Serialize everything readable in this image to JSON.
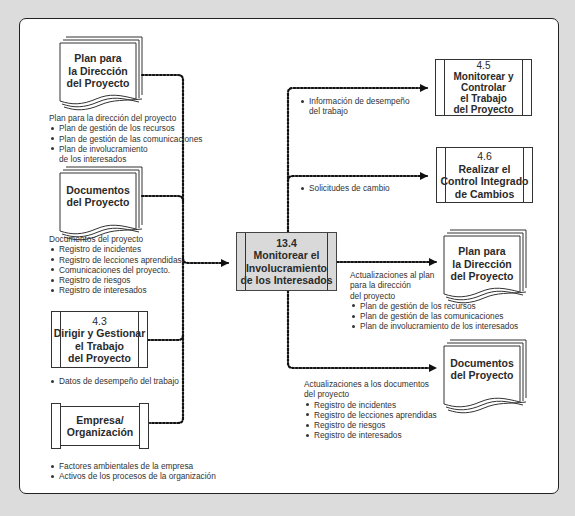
{
  "center": {
    "number": "13.4",
    "lines": [
      "Monitorear el",
      "Involucramiento",
      "de los Interesados"
    ]
  },
  "inputs": {
    "plan": {
      "title_lines": [
        "Plan para",
        "la Dirección",
        "del Proyecto"
      ],
      "desc_heading": "Plan para la dirección del proyecto",
      "items": [
        "Plan de gestión de los recursos",
        "Plan de gestión de las comunicaciones",
        "Plan de involucramiento"
      ],
      "item_continuation": "de los interesados"
    },
    "documents": {
      "title_lines": [
        "Documentos",
        "del Proyecto"
      ],
      "desc_heading": "Documentos del proyecto",
      "items": [
        "Registro de incidentes",
        "Registro de lecciones aprendidas",
        "Comunicaciones del proyecto.",
        "Registro de riesgos",
        "Registro de interesados"
      ]
    },
    "process_43": {
      "number": "4.3",
      "title_lines": [
        "Dirigir y Gestionar",
        "el Trabajo",
        "del Proyecto"
      ],
      "items": [
        "Datos de desempeño del trabajo"
      ]
    },
    "enterprise": {
      "title_lines": [
        "Empresa/",
        "Organización"
      ],
      "items": [
        "Factores ambientales de la empresa",
        "Activos de los procesos de la organización"
      ]
    }
  },
  "outputs": {
    "process_45": {
      "number": "4.5",
      "title_lines": [
        "Monitorear y",
        "Controlar",
        "el Trabajo",
        "del Proyecto"
      ],
      "label_items": [
        "Información de desempeño"
      ],
      "label_continuation": "del trabajo"
    },
    "process_46": {
      "number": "4.6",
      "title_lines": [
        "Realizar el",
        "Control Integrado",
        "de Cambios"
      ],
      "label_items": [
        "Solicitudes de cambio"
      ]
    },
    "plan_updates": {
      "title_lines": [
        "Plan para",
        "la Dirección",
        "del Proyecto"
      ],
      "desc_heading_lines": [
        "Actualizaciones al plan",
        "para la dirección",
        "del proyecto"
      ],
      "items": [
        "Plan de gestión de los recursos",
        "Plan de gestión de las comunicaciones",
        "Plan de involucramiento de los interesados"
      ]
    },
    "document_updates": {
      "title_lines": [
        "Documentos",
        "del Proyecto"
      ],
      "desc_heading_lines": [
        "Actualizaciones a los documentos",
        "del proyecto"
      ],
      "items": [
        "Registro de incidentes",
        "Registro de lecciones aprendidas",
        "Registro de riesgos",
        "Registro de interesados"
      ]
    }
  },
  "colors": {
    "background": "#dcdcdc",
    "frame": "#ffffff",
    "center_fill": "#d9d9d9",
    "line": "#1a1a1a"
  }
}
